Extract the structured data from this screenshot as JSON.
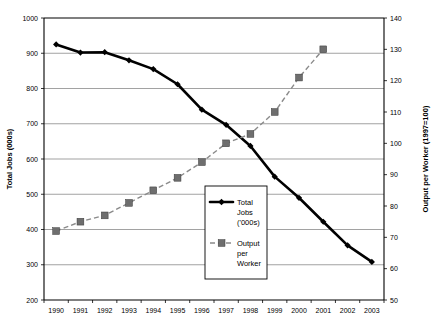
{
  "chart_data": {
    "type": "line",
    "title": "",
    "xlabel": "",
    "categories": [
      "1990",
      "1991",
      "1992",
      "1993",
      "1994",
      "1995",
      "1996",
      "1997",
      "1998",
      "1999",
      "2000",
      "2001",
      "2002",
      "2003"
    ],
    "grid": true,
    "legend_position": "center",
    "axes": {
      "left": {
        "title": "Total Jobs (000s)",
        "min": 200,
        "max": 1000,
        "step": 100,
        "ticks": [
          "200",
          "300",
          "400",
          "500",
          "600",
          "700",
          "800",
          "900",
          "1000"
        ]
      },
      "right": {
        "title": "Output per Worker (1997=100)",
        "min": 50,
        "max": 140,
        "step": 10,
        "ticks": [
          "50",
          "60",
          "70",
          "80",
          "90",
          "100",
          "110",
          "120",
          "130",
          "140"
        ]
      }
    },
    "series": [
      {
        "name": "Total Jobs ('000s)",
        "legend_label_lines": [
          "Total",
          "Jobs",
          "('000s)"
        ],
        "axis": "left",
        "marker": "diamond",
        "line_style": "solid",
        "color": "#000000",
        "x": [
          "1990",
          "1991",
          "1992",
          "1993",
          "1994",
          "1995",
          "1996",
          "1997",
          "1998",
          "1999",
          "2000",
          "2001",
          "2002",
          "2003"
        ],
        "values": [
          925,
          902,
          903,
          880,
          855,
          812,
          740,
          697,
          637,
          550,
          490,
          422,
          355,
          308
        ]
      },
      {
        "name": "Output per Worker",
        "legend_label_lines": [
          "Output",
          "per",
          "Worker"
        ],
        "axis": "right",
        "marker": "square",
        "line_style": "dashed",
        "color": "#6e6e6e",
        "x": [
          "1990",
          "1991",
          "1992",
          "1993",
          "1994",
          "1995",
          "1996",
          "1997",
          "1998",
          "1999",
          "2000",
          "2001"
        ],
        "values": [
          72,
          75,
          77,
          81,
          85,
          89,
          94,
          100,
          103,
          110,
          121,
          130
        ]
      }
    ]
  }
}
